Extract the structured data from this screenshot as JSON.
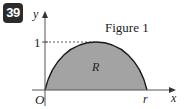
{
  "problem_number": "39",
  "figure": {
    "caption": "Figure 1",
    "region_label": "R",
    "axis_x_label": "x",
    "axis_y_label": "y",
    "origin_label": "O",
    "x_tick_label": "r",
    "y_tick_label": "1",
    "region_fill": "#a3a3a3",
    "curve_color": "#1a1a1a",
    "axis_color": "#555555"
  }
}
